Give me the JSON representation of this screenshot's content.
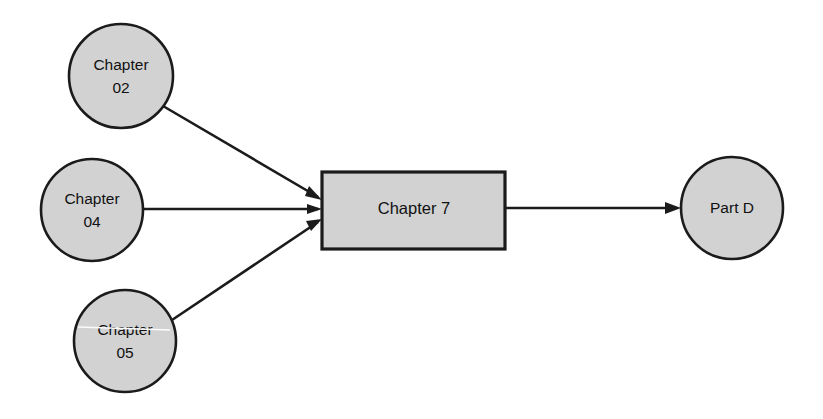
{
  "diagram": {
    "type": "directed-graph",
    "background_color": "#ffffff",
    "shape_fill_color": "#d2d2d2",
    "shape_stroke_color": "#1b1b1b",
    "nodes": [
      {
        "id": "chapter-02",
        "shape": "circle",
        "label_line1": "Chapter",
        "label_line2": "02",
        "cx": 121,
        "cy": 76,
        "r": 52
      },
      {
        "id": "chapter-04",
        "shape": "circle",
        "label_line1": "Chapter",
        "label_line2": "04",
        "cx": 92,
        "cy": 210,
        "r": 51
      },
      {
        "id": "chapter-05",
        "shape": "circle",
        "label_line1": "Chapter",
        "label_line2": "05",
        "cx": 125,
        "cy": 341,
        "r": 51
      },
      {
        "id": "chapter-7",
        "shape": "rectangle",
        "label_line1": "Chapter 7",
        "x": 322,
        "y": 172,
        "width": 183,
        "height": 77
      },
      {
        "id": "part-d",
        "shape": "circle",
        "label_line1": "Part D",
        "cx": 732,
        "cy": 208,
        "r": 51
      }
    ],
    "edges": [
      {
        "id": "edge-chapter-02-to-chapter-7",
        "from": "chapter-02",
        "to": "chapter-7",
        "x1": 163,
        "y1": 106,
        "x2": 318,
        "y2": 197
      },
      {
        "id": "edge-chapter-04-to-chapter-7",
        "from": "chapter-04",
        "to": "chapter-7",
        "x1": 143,
        "y1": 209,
        "x2": 318,
        "y2": 209
      },
      {
        "id": "edge-chapter-05-to-chapter-7",
        "from": "chapter-05",
        "to": "chapter-7",
        "x1": 172,
        "y1": 320,
        "x2": 318,
        "y2": 222
      },
      {
        "id": "edge-chapter-7-to-part-d",
        "from": "chapter-7",
        "to": "part-d",
        "x1": 505,
        "y1": 208,
        "x2": 679,
        "y2": 208
      }
    ]
  }
}
